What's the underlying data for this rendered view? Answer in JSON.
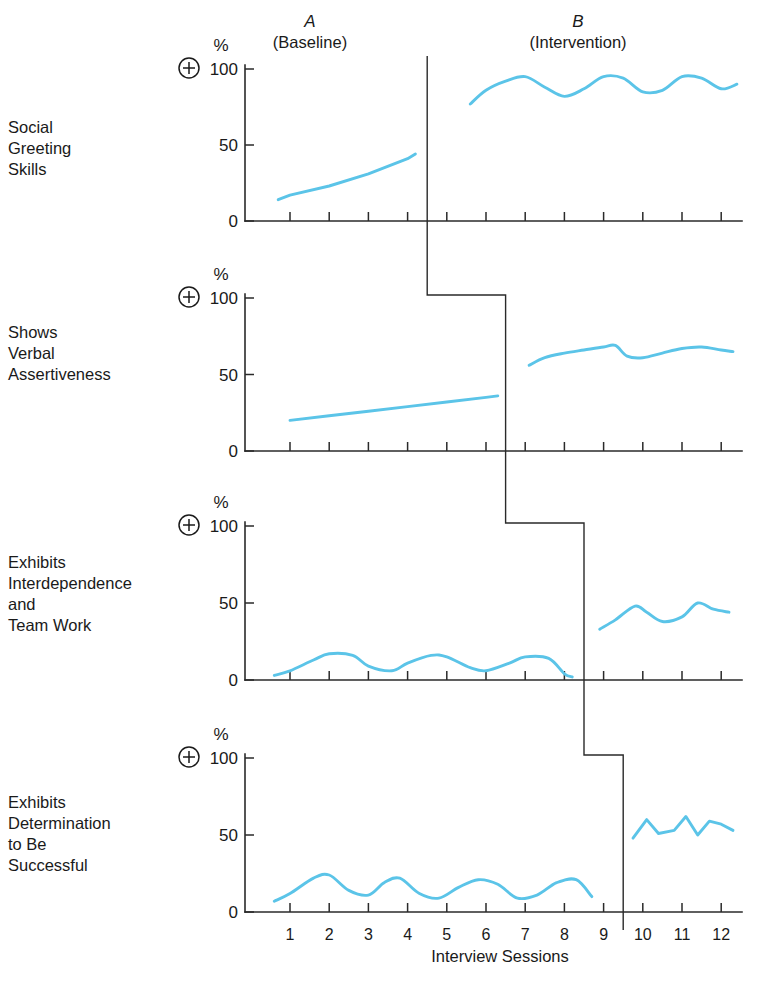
{
  "figure": {
    "x_axis_title": "Interview Sessions",
    "percent_symbol": "%",
    "plus_symbol": "+",
    "phases": [
      {
        "letter": "A",
        "name": "(Baseline)"
      },
      {
        "letter": "B",
        "name": "(Intervention)"
      }
    ],
    "y_ticks": [
      "100",
      "50",
      "0"
    ],
    "x_ticks": [
      "1",
      "2",
      "3",
      "4",
      "5",
      "6",
      "7",
      "8",
      "9",
      "10",
      "11",
      "12"
    ],
    "panel_labels": [
      [
        "Social",
        "Greeting",
        "Skills"
      ],
      [
        "Shows",
        "Verbal",
        "Assertiveness"
      ],
      [
        "Exhibits",
        "Interdependence",
        "and",
        "Team Work"
      ],
      [
        "Exhibits",
        "Determination",
        "to Be",
        "Successful"
      ]
    ],
    "colors": {
      "data_line": "#5BC4E8",
      "axis": "#2a2a2a",
      "text": "#1a1a1a",
      "background": "#ffffff"
    }
  },
  "chart_data": {
    "type": "line",
    "title": "",
    "subtitle": "",
    "xlabel": "Interview Sessions",
    "ylabel": "%",
    "xlim": [
      0.5,
      12.5
    ],
    "ylim": [
      0,
      100
    ],
    "grid": false,
    "legend": "none",
    "design": "multiple-baseline A-B across four behaviors",
    "x": [
      1,
      2,
      3,
      4,
      5,
      6,
      7,
      8,
      9,
      10,
      11,
      12
    ],
    "panels": [
      {
        "name": "Social Greeting Skills",
        "intervention_start": 4.5,
        "baseline": {
          "phase": "A (Baseline)",
          "x": [
            0.7,
            1,
            2,
            3,
            4,
            4.2
          ],
          "values": [
            14,
            17,
            23,
            31,
            41,
            44
          ]
        },
        "intervention": {
          "phase": "B (Intervention)",
          "x": [
            5.6,
            6,
            6.5,
            7,
            7.5,
            8,
            8.5,
            9,
            9.5,
            10,
            10.5,
            11,
            11.5,
            12,
            12.4
          ],
          "values": [
            77,
            86,
            92,
            95,
            88,
            82,
            87,
            95,
            94,
            85,
            86,
            95,
            94,
            87,
            90
          ]
        }
      },
      {
        "name": "Shows Verbal Assertiveness",
        "intervention_start": 6.5,
        "baseline": {
          "phase": "A (Baseline)",
          "x": [
            1,
            2,
            3,
            4,
            5,
            6,
            6.3
          ],
          "values": [
            20,
            23,
            26,
            29,
            32,
            35,
            36
          ]
        },
        "intervention": {
          "phase": "B (Intervention)",
          "x": [
            7.1,
            7.5,
            8,
            8.5,
            9,
            9.3,
            9.6,
            10,
            10.5,
            11,
            11.5,
            12,
            12.3
          ],
          "values": [
            56,
            61,
            64,
            66,
            68,
            69,
            62,
            61,
            64,
            67,
            68,
            66,
            65
          ]
        }
      },
      {
        "name": "Exhibits Interdependence and Team Work",
        "intervention_start": 8.5,
        "baseline": {
          "phase": "A (Baseline)",
          "x": [
            0.6,
            1,
            1.6,
            2,
            2.6,
            3,
            3.6,
            4,
            4.6,
            5,
            5.6,
            6,
            6.6,
            7,
            7.6,
            8,
            8.2
          ],
          "values": [
            3,
            6,
            13,
            17,
            16,
            9,
            6,
            11,
            16,
            15,
            8,
            6,
            11,
            15,
            14,
            4,
            2
          ]
        },
        "intervention": {
          "phase": "B (Intervention)",
          "x": [
            8.9,
            9.3,
            9.8,
            10.1,
            10.5,
            11,
            11.4,
            11.8,
            12.2
          ],
          "values": [
            33,
            39,
            48,
            44,
            38,
            41,
            50,
            46,
            44
          ]
        }
      },
      {
        "name": "Exhibits Determination to Be Successful",
        "intervention_start": 9.5,
        "baseline": {
          "phase": "A (Baseline)",
          "x": [
            0.6,
            1,
            1.6,
            2,
            2.5,
            3,
            3.4,
            3.8,
            4.3,
            4.8,
            5.3,
            5.8,
            6.3,
            6.8,
            7.3,
            7.8,
            8.3,
            8.7
          ],
          "values": [
            7,
            12,
            22,
            24,
            14,
            11,
            19,
            22,
            12,
            9,
            16,
            21,
            18,
            9,
            11,
            19,
            21,
            10
          ]
        },
        "intervention": {
          "phase": "B (Intervention)",
          "x": [
            9.75,
            10.1,
            10.4,
            10.8,
            11.1,
            11.4,
            11.7,
            12,
            12.3
          ],
          "values": [
            48,
            60,
            51,
            53,
            62,
            50,
            59,
            57,
            53
          ]
        }
      }
    ]
  }
}
